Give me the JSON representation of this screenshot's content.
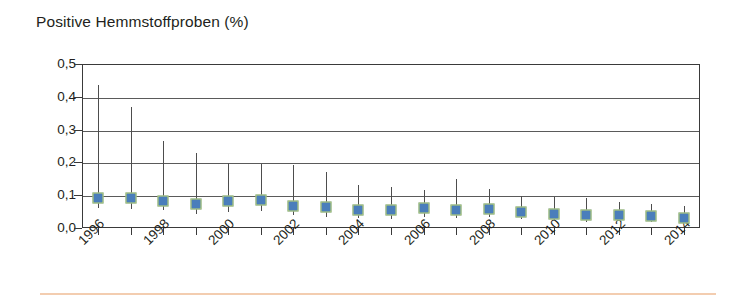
{
  "chart_data": {
    "type": "scatter",
    "title": "Positive Hemmstoffproben (%)",
    "xlabel": "",
    "ylabel": "",
    "ylim": [
      0.0,
      0.5
    ],
    "ytick_labels": [
      "0,0",
      "0,1",
      "0,2",
      "0,3",
      "0,4",
      "0,5"
    ],
    "ytick_values": [
      0.0,
      0.1,
      0.2,
      0.3,
      0.4,
      0.5
    ],
    "grid": true,
    "legend": "none",
    "decimal_separator": ",",
    "x_label_rotation_deg": -45,
    "x_label_interval_years": 2,
    "categories": [
      "1996",
      "1997",
      "1998",
      "1999",
      "2000",
      "2001",
      "2002",
      "2003",
      "2004",
      "2005",
      "2006",
      "2007",
      "2008",
      "2009",
      "2010",
      "2011",
      "2012",
      "2013",
      "2014"
    ],
    "visible_tick_labels": [
      "1996",
      "1998",
      "2000",
      "2002",
      "2004",
      "2006",
      "2008",
      "2010",
      "2012",
      "2014"
    ],
    "series": [
      {
        "name": "Positive Hemmstoffproben",
        "marker": "square",
        "marker_fill_color": "#4a7ebb",
        "marker_border_color": "#c3d86b",
        "errorbar_color": "#4d4d4d",
        "values": [
          0.09,
          0.091,
          0.082,
          0.073,
          0.081,
          0.085,
          0.068,
          0.064,
          0.056,
          0.054,
          0.06,
          0.056,
          0.058,
          0.049,
          0.042,
          0.04,
          0.039,
          0.036,
          0.031
        ],
        "error_high": [
          0.435,
          0.37,
          0.265,
          0.23,
          0.197,
          0.196,
          0.192,
          0.172,
          0.13,
          0.126,
          0.115,
          0.15,
          0.12,
          0.098,
          0.096,
          0.092,
          0.079,
          0.072,
          0.066
        ],
        "error_low": [
          0.062,
          0.058,
          0.055,
          0.042,
          0.048,
          0.052,
          0.04,
          0.035,
          0.03,
          0.028,
          0.034,
          0.03,
          0.032,
          0.026,
          0.022,
          0.019,
          0.02,
          0.018,
          0.015
        ]
      }
    ]
  },
  "footer": {
    "rule_color": "#f3cdb0"
  }
}
